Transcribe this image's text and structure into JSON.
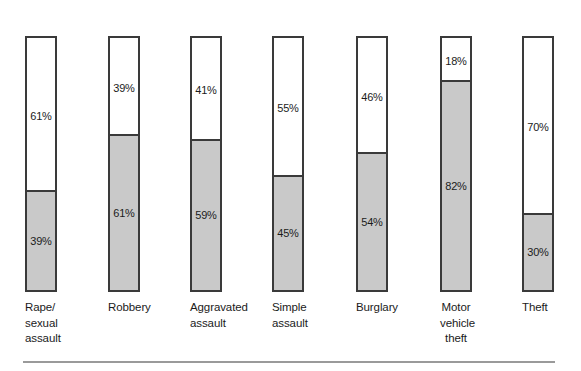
{
  "chart_data": {
    "type": "bar",
    "subtype": "100% stacked vertical bar",
    "title": "",
    "subtitle": "",
    "xlabel": "",
    "ylabel": "",
    "ylim": [
      0,
      100
    ],
    "grid": false,
    "legend": false,
    "legend_position": "none",
    "value_suffix": "%",
    "categories": [
      "Rape/\nsexual\nassault",
      "Robbery",
      "Aggravated\nassault",
      "Simple\nassault",
      "Burglary",
      "Motor\nvehicle\ntheft",
      "Theft"
    ],
    "series": [
      {
        "name": "upper-segment",
        "color": "#ffffff",
        "values": [
          61,
          39,
          41,
          55,
          46,
          18,
          70
        ],
        "labels": [
          "61%",
          "39%",
          "41%",
          "55%",
          "46%",
          "18%",
          "70%"
        ]
      },
      {
        "name": "lower-segment",
        "color": "#c9c9c9",
        "values": [
          39,
          61,
          59,
          45,
          54,
          82,
          30
        ],
        "labels": [
          "39%",
          "61%",
          "59%",
          "45%",
          "54%",
          "82%",
          "30%"
        ]
      }
    ],
    "bars": [
      {
        "category": "Rape/\nsexual\nassault",
        "label_align": "left",
        "x": 25,
        "top_value": 61,
        "top_label": "61%",
        "bottom_value": 39,
        "bottom_label": "39%"
      },
      {
        "category": "Robbery",
        "label_align": "left",
        "x": 108,
        "top_value": 39,
        "top_label": "39%",
        "bottom_value": 61,
        "bottom_label": "61%"
      },
      {
        "category": "Aggravated\nassault",
        "label_align": "left",
        "x": 190,
        "top_value": 41,
        "top_label": "41%",
        "bottom_value": 59,
        "bottom_label": "59%"
      },
      {
        "category": "Simple\nassault",
        "label_align": "left",
        "x": 272,
        "top_value": 55,
        "top_label": "55%",
        "bottom_value": 45,
        "bottom_label": "45%"
      },
      {
        "category": "Burglary",
        "label_align": "left",
        "x": 356,
        "top_value": 46,
        "top_label": "46%",
        "bottom_value": 54,
        "bottom_label": "54%"
      },
      {
        "category": "Motor\nvehicle\ntheft",
        "label_align": "center",
        "x": 440,
        "top_value": 18,
        "top_label": "18%",
        "bottom_value": 82,
        "bottom_label": "82%"
      },
      {
        "category": "Theft",
        "label_align": "left",
        "x": 522,
        "top_value": 70,
        "top_label": "70%",
        "bottom_value": 30,
        "bottom_label": "30%"
      }
    ]
  },
  "colors": {
    "fill_gray": "#c9c9c9",
    "fill_white": "#ffffff",
    "border": "#3a3a3a",
    "text": "#1b1b1b",
    "rule": "#9a9a9a",
    "background": "#ffffff"
  }
}
